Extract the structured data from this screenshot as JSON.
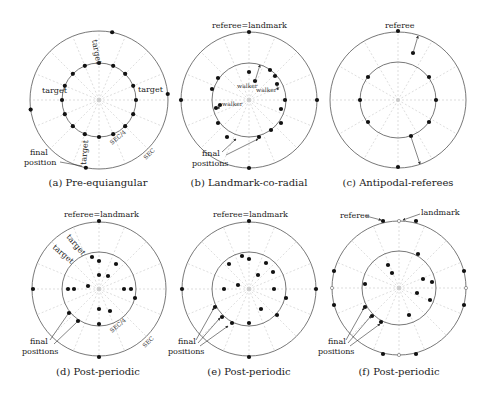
{
  "figure": {
    "panels": [
      {
        "id": "a",
        "caption": "(a) Pre-equiangular",
        "center": [
          99,
          100
        ],
        "outer_r": 69,
        "inner_r": 37,
        "inner_dots_deg": [
          90,
          67.5,
          45,
          22.5,
          0,
          -22.5,
          -45,
          -67.5,
          -90,
          -112.5,
          -135,
          -157.5,
          180,
          157.5,
          135,
          112.5
        ],
        "outer_dots_deg": [
          79,
          5,
          -101,
          188
        ],
        "labels": {
          "target_top": "target",
          "target_left": "target",
          "target_right": "target",
          "target_bottom": "target",
          "final": "final",
          "position": "position",
          "sec4": "SEC/4",
          "sec": "SEC"
        }
      },
      {
        "id": "b",
        "caption": "(b) Landmark-co-radial",
        "center": [
          249,
          100
        ],
        "outer_r": 68,
        "inner_r": 37,
        "labels": {
          "top": "referee=landmark",
          "walker1": "walker",
          "walker2": "walker",
          "walker3": "walker",
          "final": "final",
          "positions": "positions"
        }
      },
      {
        "id": "c",
        "caption": "(c) Antipodal-referees",
        "center": [
          398,
          100
        ],
        "outer_r": 68,
        "inner_r": 38,
        "labels": {
          "top": "referee"
        }
      },
      {
        "id": "d",
        "caption": "(d) Post-periodic",
        "center": [
          99,
          289
        ],
        "outer_r": 67,
        "inner_r": 37,
        "labels": {
          "top": "referee=landmark",
          "target1": "target",
          "target2": "target",
          "final": "final",
          "positions": "positions",
          "sec4": "SEC/4",
          "sec": "SEC"
        }
      },
      {
        "id": "e",
        "caption": "(e) Post-periodic",
        "center": [
          249,
          289
        ],
        "outer_r": 67,
        "inner_r": 37,
        "labels": {
          "top": "referee=landmark",
          "final": "final",
          "positions": "positions"
        }
      },
      {
        "id": "f",
        "caption": "(f) Post-periodic",
        "center": [
          399,
          288
        ],
        "outer_r": 67,
        "inner_r": 37,
        "labels": {
          "referee": "referee",
          "landmark": "landmark",
          "final": "final",
          "positions": "positions"
        }
      }
    ]
  }
}
